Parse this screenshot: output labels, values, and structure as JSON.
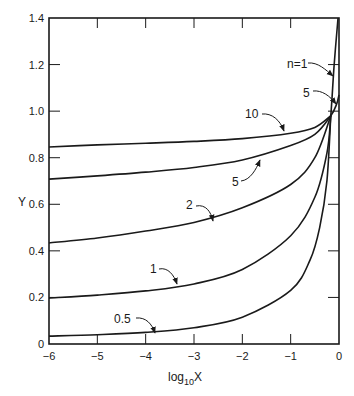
{
  "chart_data": {
    "type": "line",
    "title": "",
    "xlabel": "log10 X",
    "xlabel_base": "log",
    "xlabel_sub": "10",
    "xlabel_var": "X",
    "ylabel": "Y",
    "xlim": [
      -6,
      0
    ],
    "ylim": [
      0,
      1.4
    ],
    "grid": false,
    "legend": "inline curve labels with arrows",
    "x_ticks": [
      -6,
      -5,
      -4,
      -3,
      -2,
      -1,
      0
    ],
    "x_tick_labels": [
      "−6",
      "−5",
      "−4",
      "−3",
      "−2",
      "−1",
      "0"
    ],
    "y_ticks": [
      0,
      0.2,
      0.4,
      0.6,
      0.8,
      1.0,
      1.2,
      1.4
    ],
    "y_tick_labels": [
      "0",
      "0.2",
      "0.4",
      "0.6",
      "0.8",
      "1.0",
      "1.2",
      "1.4"
    ],
    "series": [
      {
        "name": "n=10",
        "label": "10",
        "x": [
          -6,
          -5,
          -4,
          -3,
          -2,
          -1,
          -0.5,
          -0.17
        ],
        "y": [
          0.846,
          0.855,
          0.862,
          0.87,
          0.882,
          0.905,
          0.93,
          0.98
        ]
      },
      {
        "name": "n=5",
        "label": "5",
        "x": [
          -6,
          -5,
          -4,
          -3,
          -2,
          -1,
          -0.5,
          -0.17,
          -0.05,
          0
        ],
        "y": [
          0.708,
          0.722,
          0.738,
          0.758,
          0.79,
          0.852,
          0.9,
          0.98,
          1.03,
          1.07
        ]
      },
      {
        "name": "n=2",
        "label": "2",
        "x": [
          -6,
          -5,
          -4,
          -3,
          -2,
          -1,
          -0.5,
          -0.17
        ],
        "y": [
          0.434,
          0.455,
          0.485,
          0.522,
          0.585,
          0.685,
          0.8,
          0.98
        ]
      },
      {
        "name": "n=1",
        "label": "1",
        "x": [
          -6,
          -5,
          -4,
          -3,
          -2,
          -1,
          -0.5,
          -0.25,
          -0.17,
          -0.1,
          -0.02
        ],
        "y": [
          0.197,
          0.21,
          0.228,
          0.258,
          0.32,
          0.465,
          0.63,
          0.82,
          0.98,
          1.2,
          1.4
        ]
      },
      {
        "name": "n=0.5",
        "label": "0.5",
        "x": [
          -6,
          -5,
          -4,
          -3,
          -2,
          -1,
          -0.6,
          -0.4,
          -0.25,
          -0.17
        ],
        "y": [
          0.034,
          0.04,
          0.05,
          0.07,
          0.115,
          0.23,
          0.36,
          0.5,
          0.7,
          0.98
        ]
      }
    ],
    "annotations": [
      {
        "text": "n=1",
        "points_to": "n=1 curve near Y≈1.2"
      },
      {
        "text": "5",
        "points_to": "n=5 curve near Y≈1.05"
      },
      {
        "text": "10",
        "points_to": "n=10 curve near log10X≈-1"
      },
      {
        "text": "5",
        "points_to": "n=5 curve near log10X≈-1.8"
      },
      {
        "text": "2",
        "points_to": "n=2 curve near log10X≈-2.8"
      },
      {
        "text": "1",
        "points_to": "n=1 curve near log10X≈-2.5"
      },
      {
        "text": "0.5",
        "points_to": "n=0.5 curve near log10X≈-3.7"
      }
    ]
  },
  "labels": {
    "y_axis": "Y",
    "x_axis_base": "log",
    "x_axis_sub": "10",
    "x_axis_var": "X",
    "n1": "n=1",
    "n5_top": "5",
    "n10": "10",
    "n5_mid": "5",
    "n2": "2",
    "n1_low": "1",
    "n05": "0.5"
  }
}
